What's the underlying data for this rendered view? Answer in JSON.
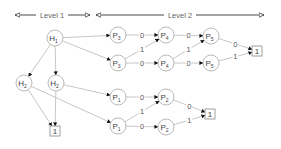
{
  "levels": [
    {
      "label": "Level 1",
      "x1": 15,
      "x2": 90,
      "y": 15,
      "text_x": 52
    },
    {
      "label": "Level 2",
      "x1": 96,
      "x2": 264,
      "y": 15,
      "text_x": 180
    }
  ],
  "nodes": [
    {
      "id": "H1",
      "base": "H",
      "sub": "1",
      "x": 55,
      "y": 38,
      "shape": "circle"
    },
    {
      "id": "H2L",
      "base": "H",
      "sub": "2",
      "x": 24,
      "y": 83,
      "shape": "circle"
    },
    {
      "id": "H2R",
      "base": "H",
      "sub": "2",
      "x": 56,
      "y": 83,
      "shape": "circle"
    },
    {
      "id": "T1",
      "base": "1",
      "sub": "",
      "x": 55,
      "y": 131,
      "shape": "box"
    },
    {
      "id": "P3a",
      "base": "P",
      "sub": "3",
      "x": 118,
      "y": 35,
      "shape": "circle"
    },
    {
      "id": "P3b",
      "base": "P",
      "sub": "3",
      "x": 118,
      "y": 63,
      "shape": "circle"
    },
    {
      "id": "P4a",
      "base": "P",
      "sub": "4",
      "x": 166,
      "y": 35,
      "shape": "circle"
    },
    {
      "id": "P4b",
      "base": "P",
      "sub": "4",
      "x": 166,
      "y": 63,
      "shape": "circle"
    },
    {
      "id": "P5a",
      "base": "P",
      "sub": "5",
      "x": 211,
      "y": 36,
      "shape": "circle"
    },
    {
      "id": "P5b",
      "base": "P",
      "sub": "5",
      "x": 211,
      "y": 63,
      "shape": "circle"
    },
    {
      "id": "T2",
      "base": "1",
      "sub": "",
      "x": 257,
      "y": 51,
      "shape": "box"
    },
    {
      "id": "P1a",
      "base": "P",
      "sub": "1",
      "x": 118,
      "y": 97,
      "shape": "circle"
    },
    {
      "id": "P1b",
      "base": "P",
      "sub": "1",
      "x": 118,
      "y": 126,
      "shape": "circle"
    },
    {
      "id": "P2a",
      "base": "P",
      "sub": "2",
      "x": 166,
      "y": 97,
      "shape": "circle"
    },
    {
      "id": "P2b",
      "base": "P",
      "sub": "2",
      "x": 166,
      "y": 127,
      "shape": "circle"
    },
    {
      "id": "T3",
      "base": "1",
      "sub": "",
      "x": 210,
      "y": 114,
      "shape": "box"
    }
  ],
  "edges": [
    {
      "from": "H1",
      "to": "H2L",
      "label": ""
    },
    {
      "from": "H1",
      "to": "H2R",
      "label": ""
    },
    {
      "from": "H1",
      "to": "P3a",
      "label": ""
    },
    {
      "from": "H1",
      "to": "P3b",
      "label": ""
    },
    {
      "from": "H2L",
      "to": "T1",
      "label": ""
    },
    {
      "from": "H2R",
      "to": "T1",
      "label": ""
    },
    {
      "from": "H2R",
      "to": "P1a",
      "label": ""
    },
    {
      "from": "H2L",
      "to": "P1b",
      "label": ""
    },
    {
      "from": "P3a",
      "to": "P4a",
      "label": "0"
    },
    {
      "from": "P3b",
      "to": "P4a",
      "label": "1"
    },
    {
      "from": "P3b",
      "to": "P4b",
      "label": "0"
    },
    {
      "from": "P4a",
      "to": "P5a",
      "label": "0"
    },
    {
      "from": "P4b",
      "to": "P5a",
      "label": "1"
    },
    {
      "from": "P4b",
      "to": "P5b",
      "label": "0"
    },
    {
      "from": "P5a",
      "to": "T2",
      "label": "0"
    },
    {
      "from": "P5b",
      "to": "T2",
      "label": "1"
    },
    {
      "from": "P1a",
      "to": "P2a",
      "label": "0"
    },
    {
      "from": "P1b",
      "to": "P2a",
      "label": "1"
    },
    {
      "from": "P1b",
      "to": "P2b",
      "label": "0"
    },
    {
      "from": "P2a",
      "to": "T3",
      "label": "0"
    },
    {
      "from": "P2b",
      "to": "T3",
      "label": "1"
    }
  ]
}
